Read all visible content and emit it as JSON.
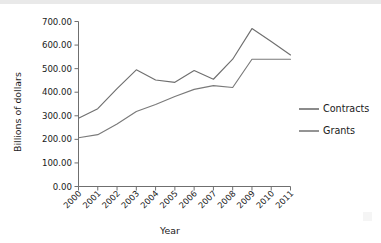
{
  "chart_data": {
    "type": "line",
    "title": "",
    "xlabel": "Year",
    "ylabel": "Billions of dollars",
    "categories": [
      "2000",
      "2001",
      "2002",
      "2003",
      "2004",
      "2005",
      "2006",
      "2007",
      "2008",
      "2009",
      "2010",
      "2011"
    ],
    "x": [
      2000,
      2001,
      2002,
      2003,
      2004,
      2005,
      2006,
      2007,
      2008,
      2009,
      2010,
      2011
    ],
    "series": [
      {
        "name": "Contracts",
        "color": "#6f6f6f",
        "values": [
          290,
          330,
          415,
          495,
          452,
          442,
          492,
          455,
          540,
          670,
          615,
          558
        ]
      },
      {
        "name": "Grants",
        "color": "#7a7a7a",
        "values": [
          207,
          220,
          265,
          318,
          348,
          382,
          412,
          428,
          420,
          540,
          540,
          540
        ]
      }
    ],
    "ylim": [
      0,
      700
    ],
    "yticks": [
      0,
      100,
      200,
      300,
      400,
      500,
      600,
      700
    ],
    "ytick_labels": [
      "0.00",
      "100.00",
      "200.00",
      "300.00",
      "400.00",
      "500.00",
      "600.00",
      "700.00"
    ],
    "grid": false,
    "legend_position": "right"
  },
  "legend": {
    "entries": [
      {
        "label": "Contracts"
      },
      {
        "label": "Grants"
      }
    ]
  },
  "axes": {
    "y_title": "Billions of dollars",
    "x_title": "Year"
  }
}
